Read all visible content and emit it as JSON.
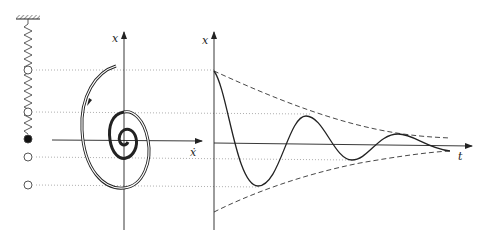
{
  "phase_portrait": {
    "vertical_axis_label": "x",
    "horizontal_axis_label": "ẋ"
  },
  "time_plot": {
    "vertical_axis_label": "x",
    "horizontal_axis_label": "t"
  },
  "spring": {
    "mass_positions_open": 4,
    "mass_position_filled": 1
  },
  "colors": {
    "line": "#222222",
    "dotted_guides": "#9a9a9a"
  }
}
